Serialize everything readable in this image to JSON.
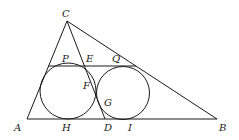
{
  "diagram": {
    "type": "geometry",
    "points": {
      "A": {
        "label": "A",
        "x": 27,
        "y": 119
      },
      "B": {
        "label": "B",
        "x": 217,
        "y": 119
      },
      "C": {
        "label": "C",
        "x": 67,
        "y": 21
      },
      "D": {
        "label": "D",
        "x": 105,
        "y": 119
      },
      "P": {
        "label": "P"
      },
      "E": {
        "label": "E"
      },
      "Q": {
        "label": "Q"
      },
      "F": {
        "label": "F"
      },
      "G": {
        "label": "G"
      },
      "H": {
        "label": "H"
      },
      "I": {
        "label": "I"
      }
    },
    "segments": [
      "AB",
      "BC",
      "CA",
      "CD",
      "PQ"
    ],
    "circles": [
      {
        "name": "circle-1",
        "tangent_points": [
          "P",
          "F",
          "H"
        ]
      },
      {
        "name": "circle-2",
        "tangent_points": [
          "Q",
          "G",
          "I"
        ]
      }
    ],
    "colors": {
      "stroke": "#1a1a1a",
      "background": "#ffffff"
    }
  }
}
